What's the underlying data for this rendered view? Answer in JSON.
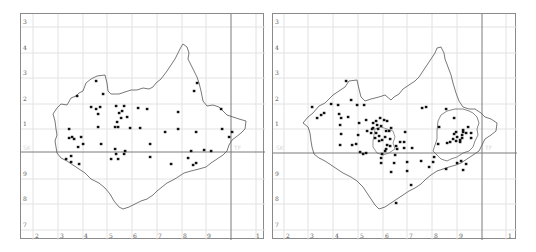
{
  "maps": [
    {
      "id": "left",
      "y_labels": [
        "3",
        "4",
        "3",
        "2",
        "1",
        "9",
        "8",
        "7"
      ],
      "x_labels": [
        "2",
        "3",
        "4",
        "5",
        "6",
        "7",
        "8",
        "9",
        "1"
      ],
      "grid_labels": [
        "SK",
        "TF"
      ],
      "points": [
        [
          95,
          80
        ],
        [
          76,
          95
        ],
        [
          102,
          93
        ],
        [
          90,
          106
        ],
        [
          95,
          108
        ],
        [
          99,
          106
        ],
        [
          97,
          113
        ],
        [
          97,
          126
        ],
        [
          115,
          105
        ],
        [
          121,
          110
        ],
        [
          118,
          112
        ],
        [
          123,
          105
        ],
        [
          120,
          117
        ],
        [
          116,
          121
        ],
        [
          114,
          126
        ],
        [
          117,
          126
        ],
        [
          129,
          127
        ],
        [
          126,
          116
        ],
        [
          137,
          107
        ],
        [
          146,
          108
        ],
        [
          139,
          127
        ],
        [
          68,
          128
        ],
        [
          68,
          137
        ],
        [
          71,
          136
        ],
        [
          73,
          138
        ],
        [
          80,
          136
        ],
        [
          77,
          146
        ],
        [
          82,
          143
        ],
        [
          65,
          158
        ],
        [
          70,
          155
        ],
        [
          70,
          161
        ],
        [
          78,
          163
        ],
        [
          100,
          143
        ],
        [
          114,
          148
        ],
        [
          115,
          153
        ],
        [
          124,
          150
        ],
        [
          123,
          153
        ],
        [
          110,
          158
        ],
        [
          117,
          158
        ],
        [
          149,
          143
        ],
        [
          149,
          156
        ],
        [
          170,
          163
        ],
        [
          164,
          131
        ],
        [
          177,
          128
        ],
        [
          177,
          111
        ],
        [
          195,
          131
        ],
        [
          190,
          150
        ],
        [
          203,
          149
        ],
        [
          195,
          162
        ],
        [
          192,
          164
        ],
        [
          210,
          150
        ],
        [
          221,
          128
        ],
        [
          228,
          136
        ],
        [
          231,
          131
        ],
        [
          196,
          82
        ],
        [
          193,
          90
        ],
        [
          220,
          108
        ],
        [
          187,
          157
        ]
      ],
      "bold_line_x": 230,
      "bold_line_y": 151
    },
    {
      "id": "right",
      "y_labels": [
        "3",
        "4",
        "3",
        "2",
        "1",
        "9",
        "8",
        "7"
      ],
      "x_labels": [
        "2",
        "3",
        "4",
        "5",
        "6",
        "7",
        "8",
        "9",
        "1"
      ],
      "grid_labels": [
        "SK",
        "TF"
      ],
      "points": [
        [
          311,
          106
        ],
        [
          316,
          117
        ],
        [
          320,
          114
        ],
        [
          323,
          112
        ],
        [
          330,
          103
        ],
        [
          337,
          104
        ],
        [
          338,
          113
        ],
        [
          340,
          117
        ],
        [
          339,
          124
        ],
        [
          340,
          133
        ],
        [
          339,
          144
        ],
        [
          347,
          116
        ],
        [
          351,
          144
        ],
        [
          358,
          122
        ],
        [
          357,
          134
        ],
        [
          355,
          143
        ],
        [
          356,
          104
        ],
        [
          350,
          99
        ],
        [
          345,
          80
        ],
        [
          363,
          104
        ],
        [
          365,
          119
        ],
        [
          366,
          130
        ],
        [
          370,
          132
        ],
        [
          372,
          127
        ],
        [
          372,
          122
        ],
        [
          376,
          124
        ],
        [
          375,
          120
        ],
        [
          371,
          128
        ],
        [
          375,
          132
        ],
        [
          378,
          135
        ],
        [
          374,
          137
        ],
        [
          378,
          140
        ],
        [
          381,
          139
        ],
        [
          384,
          136
        ],
        [
          380,
          125
        ],
        [
          379,
          117
        ],
        [
          383,
          119
        ],
        [
          386,
          120
        ],
        [
          388,
          130
        ],
        [
          390,
          127
        ],
        [
          381,
          153
        ],
        [
          380,
          157
        ],
        [
          380,
          162
        ],
        [
          385,
          148
        ],
        [
          386,
          144
        ],
        [
          389,
          145
        ],
        [
          395,
          145
        ],
        [
          394,
          154
        ],
        [
          393,
          162
        ],
        [
          390,
          171
        ],
        [
          396,
          148
        ],
        [
          399,
          141
        ],
        [
          403,
          147
        ],
        [
          403,
          141
        ],
        [
          404,
          131
        ],
        [
          406,
          161
        ],
        [
          406,
          170
        ],
        [
          411,
          147
        ],
        [
          410,
          184
        ],
        [
          395,
          202
        ],
        [
          420,
          160
        ],
        [
          421,
          107
        ],
        [
          425,
          106
        ],
        [
          428,
          166
        ],
        [
          432,
          161
        ],
        [
          433,
          156
        ],
        [
          437,
          143
        ],
        [
          438,
          126
        ],
        [
          445,
          108
        ],
        [
          446,
          142
        ],
        [
          445,
          168
        ],
        [
          453,
          117
        ],
        [
          456,
          162
        ],
        [
          460,
          160
        ],
        [
          462,
          169
        ],
        [
          465,
          163
        ],
        [
          459,
          141
        ],
        [
          462,
          131
        ],
        [
          365,
          152
        ],
        [
          359,
          151
        ],
        [
          362,
          153
        ],
        [
          384,
          150
        ],
        [
          385,
          130
        ],
        [
          377,
          128
        ],
        [
          389,
          138
        ]
      ],
      "cluster_points": [
        [
          449,
          141
        ],
        [
          452,
          138
        ],
        [
          453,
          133
        ],
        [
          455,
          131
        ],
        [
          456,
          136
        ],
        [
          455,
          140
        ],
        [
          459,
          139
        ],
        [
          461,
          134
        ],
        [
          462,
          129
        ],
        [
          461,
          137
        ],
        [
          465,
          132
        ],
        [
          467,
          126
        ],
        [
          470,
          132
        ],
        [
          470,
          137
        ]
      ],
      "bold_line_x": 481,
      "bold_line_y": 152
    }
  ]
}
